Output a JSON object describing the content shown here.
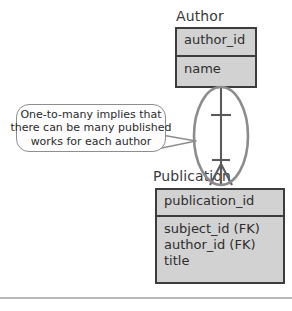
{
  "diagram": {
    "title_author": "Author",
    "title_publication": "Publication",
    "entities": [
      {
        "name": "Author",
        "key_field": "author_id",
        "attributes": [
          "name"
        ]
      },
      {
        "name": "Publication",
        "key_field": "publication_id",
        "attributes": [
          "subject_id (FK)",
          "author_id (FK)",
          "title"
        ]
      }
    ],
    "author": {
      "label": "Author",
      "key_field": "author_id",
      "attr_1": "name"
    },
    "publication": {
      "label": "Publication",
      "key_field": "publication_id",
      "attr_1": "subject_id (FK)",
      "attr_2": "author_id (FK)",
      "attr_3": "title"
    },
    "relationship": {
      "from": "Author",
      "to": "Publication",
      "cardinality_from": "one",
      "cardinality_to": "many",
      "notation": "crow's foot"
    },
    "callout": {
      "line_1": "One-to-many implies that",
      "line_2": "there can be many published",
      "line_3": "works for each author"
    },
    "colors": {
      "entity_fill": "#d2d2d2",
      "entity_border": "#3c3c3c",
      "text": "#2d2d2d",
      "callout_border": "#8e8e8e",
      "callout_fill": "#fdfdfd",
      "highlight_ellipse": "#8c8c8c",
      "line": "#5a5a5a"
    }
  }
}
